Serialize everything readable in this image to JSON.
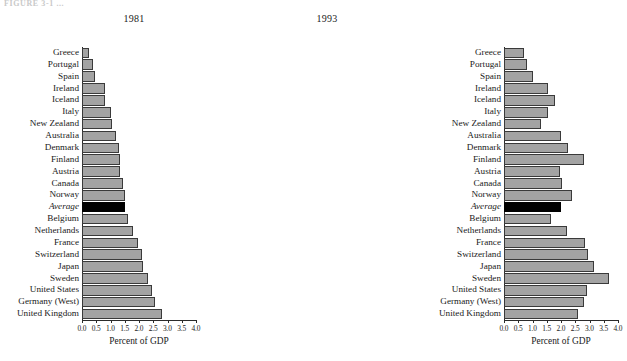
{
  "top_caption": "FIGURE 3-1   ...",
  "axis_title": "Percent of GDP",
  "categories": [
    "Greece",
    "Portugal",
    "Spain",
    "Ireland",
    "Iceland",
    "Italy",
    "New Zealand",
    "Australia",
    "Denmark",
    "Finland",
    "Austria",
    "Canada",
    "Norway",
    "Average",
    "Belgium",
    "Netherlands",
    "France",
    "Switzerland",
    "Japan",
    "Sweden",
    "United States",
    "Germany (West)",
    "United Kingdom"
  ],
  "highlight_category": "Average",
  "colors": {
    "bar_fill": "#a3a3a3",
    "bar_stroke": "#3a3a3a",
    "highlight_fill": "#000000",
    "axis": "#2b2b2b",
    "background": "#ffffff"
  },
  "tick_labels": [
    "0.0",
    "0.5",
    "1.0",
    "1.5",
    "2.0",
    "2.5",
    "3.0",
    "3.5",
    "4.0"
  ],
  "tick_values": [
    0.0,
    0.5,
    1.0,
    1.5,
    2.0,
    2.5,
    3.0,
    3.5,
    4.0
  ],
  "chart_data": [
    {
      "type": "bar",
      "orientation": "horizontal",
      "title": "1981",
      "xlabel": "Percent of GDP",
      "ylabel": "",
      "xlim": [
        0.0,
        4.0
      ],
      "grid": false,
      "legend": "none",
      "highlight": "Average",
      "categories": [
        "Greece",
        "Portugal",
        "Spain",
        "Ireland",
        "Iceland",
        "Italy",
        "New Zealand",
        "Australia",
        "Denmark",
        "Finland",
        "Austria",
        "Canada",
        "Norway",
        "Average",
        "Belgium",
        "Netherlands",
        "France",
        "Switzerland",
        "Japan",
        "Sweden",
        "United States",
        "Germany (West)",
        "United Kingdom"
      ],
      "values": [
        0.25,
        0.4,
        0.45,
        0.8,
        0.8,
        1.0,
        1.05,
        1.2,
        1.3,
        1.35,
        1.35,
        1.45,
        1.5,
        1.5,
        1.6,
        1.8,
        1.95,
        2.1,
        2.15,
        2.3,
        2.45,
        2.55,
        2.8
      ]
    },
    {
      "type": "bar",
      "orientation": "horizontal",
      "title": "1993",
      "xlabel": "Percent of GDP",
      "ylabel": "",
      "xlim": [
        0.0,
        4.0
      ],
      "grid": false,
      "legend": "none",
      "highlight": "Average",
      "categories": [
        "Greece",
        "Portugal",
        "Spain",
        "Ireland",
        "Iceland",
        "Italy",
        "New Zealand",
        "Australia",
        "Denmark",
        "Finland",
        "Austria",
        "Canada",
        "Norway",
        "Average",
        "Belgium",
        "Netherlands",
        "France",
        "Switzerland",
        "Japan",
        "Sweden",
        "United States",
        "Germany (West)",
        "United Kingdom"
      ],
      "values": [
        0.7,
        0.8,
        1.0,
        1.55,
        1.8,
        1.55,
        1.3,
        2.0,
        2.25,
        2.8,
        1.95,
        2.05,
        2.4,
        2.0,
        1.65,
        2.2,
        2.85,
        2.95,
        3.15,
        3.7,
        2.9,
        2.8,
        2.6
      ]
    }
  ]
}
